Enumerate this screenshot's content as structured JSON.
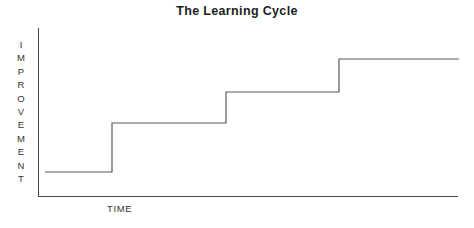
{
  "chart_data": {
    "type": "line",
    "subtype": "step",
    "title": "The Learning Cycle",
    "xlabel": "TIME",
    "ylabel": "IMPROVEMENT",
    "ylabel_letters": [
      "I",
      "M",
      "P",
      "R",
      "O",
      "V",
      "E",
      "M",
      "E",
      "N",
      "T"
    ],
    "grid": false,
    "legend": null,
    "xtick_labels": [],
    "ytick_labels": [],
    "axis_color": "#4a4a4a",
    "line_color": "#5a5a5a",
    "background_color": "#ffffff",
    "title_color": "#1d1d1d",
    "label_color": "#333333",
    "xlim": [
      0,
      10
    ],
    "ylim": [
      0,
      10
    ],
    "series": [
      {
        "name": "Improvement",
        "step_count": 4,
        "points": [
          {
            "x": 0.17,
            "y": 2.6
          },
          {
            "x": 1.81,
            "y": 2.6
          },
          {
            "x": 1.81,
            "y": 4.9
          },
          {
            "x": 4.49,
            "y": 4.9
          },
          {
            "x": 4.49,
            "y": 6.4
          },
          {
            "x": 7.17,
            "y": 6.4
          },
          {
            "x": 7.17,
            "y": 8.0
          },
          {
            "x": 10.0,
            "y": 8.0
          }
        ],
        "plateau_values": [
          2.6,
          4.9,
          6.4,
          8.0
        ]
      }
    ],
    "pixel_geometry": {
      "axis_x": 38,
      "axis_y": 196,
      "axis_top": 28,
      "axis_right": 458,
      "polyline": "45,172 112,172 112,123 226,123 226,92 339,92 339,59 459,59"
    }
  }
}
